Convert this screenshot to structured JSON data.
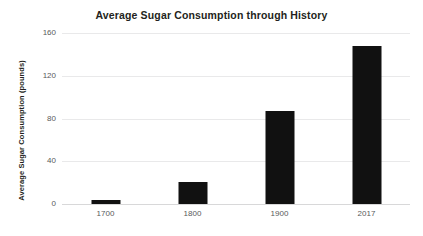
{
  "chart_data": {
    "type": "bar",
    "title": "Average Sugar Consumption through History",
    "xlabel": "",
    "ylabel": "Average Sugar Consumption (pounds)",
    "categories": [
      "1700",
      "1800",
      "1900",
      "2017"
    ],
    "values": [
      4,
      21,
      87,
      148
    ],
    "series": [
      {
        "name": "Average Sugar Consumption (pounds)",
        "values": [
          4,
          21,
          87,
          148
        ]
      }
    ],
    "ylim": [
      0,
      160
    ],
    "yticks": [
      0,
      40,
      80,
      120,
      160
    ],
    "ytick_labels": [
      "0",
      "40",
      "80",
      "120",
      "160"
    ],
    "grid": true,
    "grid_axis": "y",
    "legend": false,
    "legend_position": "none",
    "bar_color": "#111111",
    "grid_color": "#e9e9ea",
    "text_color": "#231f20",
    "tick_color": "#58595b",
    "background": "#ffffff"
  }
}
